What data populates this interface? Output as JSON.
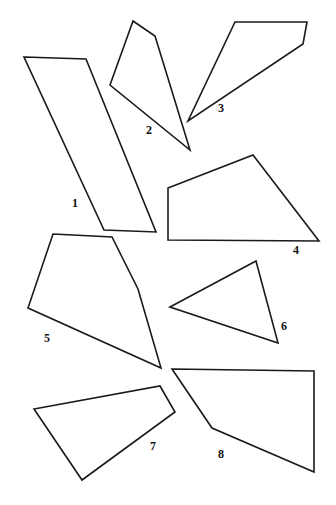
{
  "figure": {
    "width": 336,
    "height": 505,
    "background_color": "#ffffff",
    "stroke_color": "#1a1a1a",
    "label_color": "#111111"
  },
  "shapes": [
    {
      "label": "1",
      "kind": "quadrilateral",
      "points": "24,57 86,59 156,232 104,230",
      "label_x": 72,
      "label_y": 197
    },
    {
      "label": "2",
      "kind": "quadrilateral",
      "points": "133,21 155,36 190,150 110,85",
      "label_x": 146,
      "label_y": 124
    },
    {
      "label": "3",
      "kind": "quadrilateral",
      "points": "235,22 307,22 303,44 188,121",
      "label_x": 218,
      "label_y": 102
    },
    {
      "label": "4",
      "kind": "quadrilateral",
      "points": "168,188 253,155 319,241 168,240",
      "label_x": 293,
      "label_y": 244
    },
    {
      "label": "5",
      "kind": "pentagon",
      "points": "53,234 112,237 138,289 161,368 28,308",
      "label_x": 44,
      "label_y": 332
    },
    {
      "label": "6",
      "kind": "triangle",
      "points": "170,307 256,261 278,343",
      "label_x": 281,
      "label_y": 320
    },
    {
      "label": "7",
      "kind": "quadrilateral",
      "points": "34,409 160,386 175,412 82,480",
      "label_x": 150,
      "label_y": 440
    },
    {
      "label": "8",
      "kind": "quadrilateral",
      "points": "172,369 314,371 314,472 212,428",
      "label_x": 218,
      "label_y": 448
    }
  ]
}
